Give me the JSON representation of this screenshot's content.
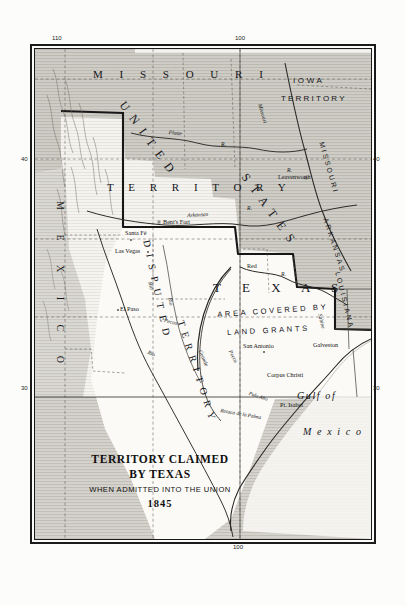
{
  "map": {
    "title_lines": {
      "line1": "TERRITORY CLAIMED",
      "line2": "BY TEXAS",
      "line3": "WHEN ADMITTED INTO THE UNION",
      "year": "1845"
    },
    "graticule": {
      "top_left": "110",
      "top_right": "100",
      "bottom_center": "100",
      "left_upper": "40",
      "left_lower": "30",
      "right_upper": "40",
      "right_lower": "30"
    },
    "region_labels": [
      {
        "name": "missouri-territory-upper",
        "text": "M I S S O U R I"
      },
      {
        "name": "territory-lower",
        "text": "T E R R I T O R Y"
      },
      {
        "name": "iowa-territory-line1",
        "text": "IOWA"
      },
      {
        "name": "iowa-territory-line2",
        "text": "TERRITORY"
      },
      {
        "name": "united",
        "text": "UNITED"
      },
      {
        "name": "states",
        "text": "STATES"
      },
      {
        "name": "disputed",
        "text": "DISPUTED"
      },
      {
        "name": "disputed-territory",
        "text": "TERRITORY"
      },
      {
        "name": "texas",
        "text": "T E X A S"
      },
      {
        "name": "land-grants-line1",
        "text": "AREA COVERED BY"
      },
      {
        "name": "land-grants-line2",
        "text": "LAND GRANTS"
      },
      {
        "name": "arkansas-state",
        "text": "ARKANSAS"
      },
      {
        "name": "louisiana-state",
        "text": "LOUISIANA"
      },
      {
        "name": "missouri-state",
        "text": "MISSOURI"
      },
      {
        "name": "mexico-country",
        "text": "M E X I C O"
      },
      {
        "name": "gulf-of",
        "text": "Gulf of"
      },
      {
        "name": "gulf-mexico",
        "text": "M e x i c o"
      }
    ],
    "cities": [
      {
        "name": "bents-fort",
        "label": "Bent's Fort"
      },
      {
        "name": "leavenworth",
        "label": "Leavenworth"
      },
      {
        "name": "santa-fe",
        "label": "Santa Fé"
      },
      {
        "name": "las-vegas",
        "label": "Las Vegas"
      },
      {
        "name": "el-paso",
        "label": "El Paso"
      },
      {
        "name": "san-antonio",
        "label": "San Antonio"
      },
      {
        "name": "galveston",
        "label": "Galveston"
      },
      {
        "name": "corpus-christi",
        "label": "Corpus Christi"
      },
      {
        "name": "pt-isabel",
        "label": "Pt. Isabel"
      },
      {
        "name": "palo-alto",
        "label": "Palo Alto"
      },
      {
        "name": "resaca-de-la-palma",
        "label": "Resaca de la Palma"
      }
    ],
    "rivers": [
      {
        "name": "platte-river",
        "label": "Platte"
      },
      {
        "name": "platte-river-r",
        "label": "R."
      },
      {
        "name": "missouri-river",
        "label": "Missouri"
      },
      {
        "name": "missouri-river-r",
        "label": "R."
      },
      {
        "name": "arkansas-river",
        "label": "Arkansas"
      },
      {
        "name": "arkansas-river-r",
        "label": "R."
      },
      {
        "name": "red-river",
        "label": "Red"
      },
      {
        "name": "red-river-r",
        "label": "R."
      },
      {
        "name": "rio-grande-rio",
        "label": "Rio"
      },
      {
        "name": "rio-grande-grande",
        "label": "Grande"
      },
      {
        "name": "rio-pecos-rio",
        "label": "Rio"
      },
      {
        "name": "rio-pecos-pecos",
        "label": "Pecos"
      },
      {
        "name": "pecos-lower",
        "label": "Pecos"
      },
      {
        "name": "sabine-river",
        "label": "Sabine"
      },
      {
        "name": "rio-west",
        "label": "Rio"
      }
    ],
    "colors": {
      "shaded_territory": "#cfcdc8",
      "unshaded_territory": "#fbfaf7",
      "ink": "#1b1b1b",
      "paper": "#fcfcfa"
    }
  }
}
